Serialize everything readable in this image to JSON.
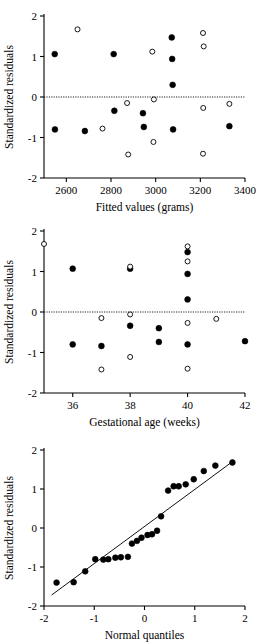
{
  "figure": {
    "name": "residual-diagnostic-panels",
    "background": "#ffffff",
    "foreground": "#000000",
    "panel_count": 3
  },
  "chart_data": [
    {
      "type": "scatter",
      "name": "residuals-vs-fitted",
      "title": "",
      "xlabel": "Fitted values (grams)",
      "ylabel": "Standardized residuals",
      "xlim": [
        2500,
        3400
      ],
      "ylim": [
        -2,
        2
      ],
      "xticks": [
        2600,
        2800,
        3000,
        3200,
        3400
      ],
      "yticks": [
        -2,
        -1,
        0,
        1,
        2
      ],
      "xticklabels": [
        "2600",
        "2800",
        "3000",
        "3200",
        "3400"
      ],
      "yticklabels": [
        "-2",
        "-1",
        "0",
        "1",
        "2"
      ],
      "grid": false,
      "legend": "none",
      "reference_line": {
        "type": "horizontal",
        "y": 0,
        "style": "dotted"
      },
      "series": [
        {
          "name": "filled",
          "marker": "filled-circle",
          "points": [
            {
              "x": 2548,
              "y": 1.06
            },
            {
              "x": 2683,
              "y": -0.84
            },
            {
              "x": 2549,
              "y": -0.8
            },
            {
              "x": 2812,
              "y": 1.06
            },
            {
              "x": 2815,
              "y": -0.34
            },
            {
              "x": 2943,
              "y": -0.4
            },
            {
              "x": 2947,
              "y": -0.74
            },
            {
              "x": 3072,
              "y": 1.47
            },
            {
              "x": 3074,
              "y": 0.94
            },
            {
              "x": 3076,
              "y": 0.3
            },
            {
              "x": 3078,
              "y": -0.8
            },
            {
              "x": 3330,
              "y": -0.72
            }
          ]
        },
        {
          "name": "open",
          "marker": "open-circle",
          "points": [
            {
              "x": 2650,
              "y": 1.67
            },
            {
              "x": 2762,
              "y": -0.78
            },
            {
              "x": 2872,
              "y": -0.15
            },
            {
              "x": 2877,
              "y": -1.42
            },
            {
              "x": 2985,
              "y": 1.12
            },
            {
              "x": 2992,
              "y": -0.06
            },
            {
              "x": 2990,
              "y": -1.11
            },
            {
              "x": 3212,
              "y": 1.58
            },
            {
              "x": 3215,
              "y": 1.25
            },
            {
              "x": 3213,
              "y": -0.27
            },
            {
              "x": 3212,
              "y": -1.4
            },
            {
              "x": 3330,
              "y": -0.17
            }
          ]
        }
      ]
    },
    {
      "type": "scatter",
      "name": "residuals-vs-gestational-age",
      "title": "",
      "xlabel": "Gestational age (weeks)",
      "ylabel": "Standardized residuals",
      "xlim": [
        35,
        42
      ],
      "ylim": [
        -2,
        2
      ],
      "xticks": [
        36,
        38,
        40,
        42
      ],
      "yticks": [
        -2,
        -1,
        0,
        1,
        2
      ],
      "xticklabels": [
        "36",
        "38",
        "40",
        "42"
      ],
      "yticklabels": [
        "-2",
        "-1",
        "0",
        "1",
        "2"
      ],
      "grid": false,
      "legend": "none",
      "reference_line": {
        "type": "horizontal",
        "y": 0,
        "style": "dotted"
      },
      "series": [
        {
          "name": "filled",
          "marker": "filled-circle",
          "points": [
            {
              "x": 36.0,
              "y": 1.07
            },
            {
              "x": 36.0,
              "y": -0.8
            },
            {
              "x": 37.0,
              "y": -0.84
            },
            {
              "x": 38.0,
              "y": 1.07
            },
            {
              "x": 38.0,
              "y": -0.34
            },
            {
              "x": 39.0,
              "y": -0.4
            },
            {
              "x": 39.0,
              "y": -0.74
            },
            {
              "x": 40.0,
              "y": 1.48
            },
            {
              "x": 40.0,
              "y": 0.94
            },
            {
              "x": 40.0,
              "y": 0.31
            },
            {
              "x": 40.0,
              "y": -0.8
            },
            {
              "x": 42.0,
              "y": -0.72
            }
          ]
        },
        {
          "name": "open",
          "marker": "open-circle",
          "points": [
            {
              "x": 35.0,
              "y": 1.68
            },
            {
              "x": 37.0,
              "y": -0.15
            },
            {
              "x": 37.0,
              "y": -1.42
            },
            {
              "x": 38.0,
              "y": 1.12
            },
            {
              "x": 38.0,
              "y": -0.06
            },
            {
              "x": 38.0,
              "y": -1.11
            },
            {
              "x": 40.0,
              "y": 1.62
            },
            {
              "x": 40.0,
              "y": 1.25
            },
            {
              "x": 40.0,
              "y": -0.27
            },
            {
              "x": 40.0,
              "y": -1.4
            },
            {
              "x": 41.0,
              "y": -0.17
            }
          ]
        }
      ]
    },
    {
      "type": "scatter",
      "name": "normal-quantile-plot",
      "title": "",
      "xlabel": "Normal quantiles",
      "ylabel": "Standardized residuals",
      "xlim": [
        -2,
        2
      ],
      "ylim": [
        -2,
        2
      ],
      "xticks": [
        -2,
        -1,
        0,
        1,
        2
      ],
      "yticks": [
        -2,
        -1,
        0,
        1,
        2
      ],
      "xticklabels": [
        "-2",
        "-1",
        "0",
        "1",
        "2"
      ],
      "yticklabels": [
        "-2",
        "-1",
        "0",
        "1",
        "2"
      ],
      "grid": false,
      "legend": "none",
      "reference_line": {
        "type": "diagonal",
        "x0": -1.85,
        "y0": -1.72,
        "x1": 1.78,
        "y1": 1.73,
        "style": "solid"
      },
      "series": [
        {
          "name": "filled",
          "marker": "filled-circle",
          "points": [
            {
              "x": -1.75,
              "y": -1.4
            },
            {
              "x": -1.41,
              "y": -1.39
            },
            {
              "x": -1.18,
              "y": -1.11
            },
            {
              "x": -0.98,
              "y": -0.8
            },
            {
              "x": -0.82,
              "y": -0.81
            },
            {
              "x": -0.72,
              "y": -0.8
            },
            {
              "x": -0.58,
              "y": -0.76
            },
            {
              "x": -0.47,
              "y": -0.75
            },
            {
              "x": -0.33,
              "y": -0.74
            },
            {
              "x": -0.25,
              "y": -0.4
            },
            {
              "x": -0.15,
              "y": -0.33
            },
            {
              "x": -0.06,
              "y": -0.25
            },
            {
              "x": 0.06,
              "y": -0.18
            },
            {
              "x": 0.15,
              "y": -0.16
            },
            {
              "x": 0.25,
              "y": -0.07
            },
            {
              "x": 0.33,
              "y": 0.3
            },
            {
              "x": 0.47,
              "y": 0.96
            },
            {
              "x": 0.58,
              "y": 1.07
            },
            {
              "x": 0.68,
              "y": 1.07
            },
            {
              "x": 0.82,
              "y": 1.12
            },
            {
              "x": 0.98,
              "y": 1.25
            },
            {
              "x": 1.18,
              "y": 1.46
            },
            {
              "x": 1.41,
              "y": 1.6
            },
            {
              "x": 1.75,
              "y": 1.68
            }
          ]
        }
      ]
    }
  ]
}
